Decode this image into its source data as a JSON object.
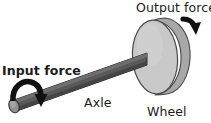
{
  "diagram": {
    "labels": {
      "output_force": "Output force",
      "input_force": "Input force",
      "axle": "Axle",
      "wheel": "Wheel"
    },
    "parts": [
      {
        "name": "wheel",
        "shape": "disc",
        "label": "Wheel",
        "face_color": "#c9c9c9",
        "rim_color": "#a8a8a8",
        "outline_color": "#4a4a4a"
      },
      {
        "name": "axle",
        "shape": "cylindrical-bar",
        "label": "Axle",
        "body_color": "#595959",
        "highlight_color": "#6e6e6e",
        "shadow_color": "#3f3f3f",
        "end_cap_color": "#8a8a8a",
        "outline_color": "#2b2b2b"
      },
      {
        "name": "input-force-arrow",
        "shape": "curved-rotation-arrow",
        "label": "Input force",
        "color": "#111111",
        "direction": "clockwise-down"
      },
      {
        "name": "output-force-arrow",
        "shape": "bent-arrow",
        "label": "Output force",
        "color": "#111111",
        "direction": "down-right"
      }
    ],
    "background_color": "#ffffff"
  }
}
